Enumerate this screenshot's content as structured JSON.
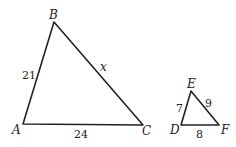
{
  "diagram": {
    "type": "similar-triangles",
    "triangles": [
      {
        "name": "ABC",
        "vertices": {
          "A": {
            "label": "A",
            "x": 23,
            "y": 124
          },
          "B": {
            "label": "B",
            "x": 54,
            "y": 22
          },
          "C": {
            "label": "C",
            "x": 143,
            "y": 125
          }
        },
        "sides": {
          "AB": "21",
          "BC": "x",
          "AC": "24"
        }
      },
      {
        "name": "DEF",
        "vertices": {
          "D": {
            "label": "D",
            "x": 181,
            "y": 125
          },
          "E": {
            "label": "E",
            "x": 191,
            "y": 91
          },
          "F": {
            "label": "F",
            "x": 219,
            "y": 125
          }
        },
        "sides": {
          "DE": "7",
          "EF": "9",
          "DF": "8"
        }
      }
    ]
  }
}
